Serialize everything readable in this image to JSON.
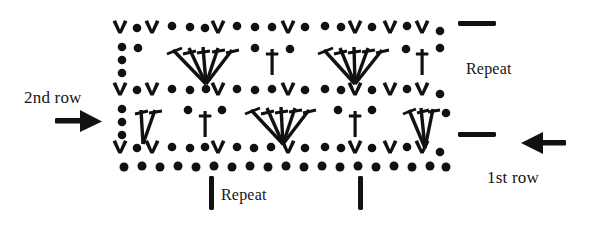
{
  "diagram": {
    "kind": "crochet-stitch-chart",
    "ink_color": "#111111",
    "background_color": "#ffffff",
    "labels": {
      "second_row": "2nd row",
      "first_row": "1st row",
      "repeat_right": "Repeat",
      "repeat_bottom": "Repeat"
    },
    "markers": {
      "right_dash_top": "repeat-boundary-dash",
      "right_dash_bottom": "repeat-boundary-dash",
      "bottom_bar_left": "repeat-boundary-bar",
      "bottom_bar_right": "repeat-boundary-bar",
      "arrow_left": "arrow-right-icon",
      "arrow_right": "arrow-left-icon"
    },
    "legend_symbols": {
      "dot": "chain-stitch",
      "v": "single-crochet-v",
      "t": "double-crochet",
      "fan": "shell-of-five-double-crochet"
    },
    "rows": [
      {
        "name": "top-v-row",
        "y": 30,
        "symbols": "V . V . . . V . . . V . . V . V ."
      },
      {
        "name": "upper-band",
        "y": 62,
        "symbols": "chain-column, fan, t, fan, t"
      },
      {
        "name": "middle-v-row",
        "y": 92,
        "symbols": "V . V . . . V . . . V . . V . V ."
      },
      {
        "name": "lower-band",
        "y": 122,
        "symbols": "chain-column, half-fan, t, fan, t, half-fan"
      },
      {
        "name": "bottom-v-row",
        "y": 150,
        "symbols": "V . V . . . V . . . V . . V . V ."
      },
      {
        "name": "foundation-chain",
        "y": 166,
        "symbols": "continuous chain of dots"
      }
    ],
    "geometry": {
      "chart_left": 112,
      "chart_right": 452,
      "v_row_y": [
        30,
        92,
        150
      ],
      "dash_top": {
        "x": 458,
        "y": 22,
        "w": 36,
        "h": 5
      },
      "dash_bottom": {
        "x": 458,
        "y": 133,
        "w": 36,
        "h": 5
      },
      "bar_left": {
        "x": 209,
        "y": 176,
        "w": 5,
        "h": 34
      },
      "bar_right": {
        "x": 358,
        "y": 176,
        "w": 5,
        "h": 34
      }
    }
  }
}
